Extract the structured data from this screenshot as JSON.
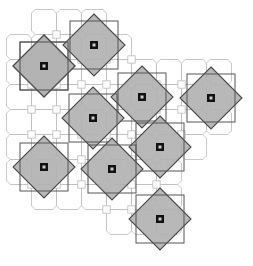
{
  "figure": {
    "width": 253,
    "height": 266,
    "background_color": "#ffffff"
  },
  "style": {
    "diamond_fill": "#b2b2b2",
    "diamond_stroke": "#4a4a4a",
    "frame_stroke": "#555555",
    "lattice_stroke": "#b9b9b9",
    "marker_fill": "#111111",
    "marker_inner_fill": "#cccccc",
    "diamond_stroke_width": 1.1,
    "frame_stroke_width": 1.0,
    "lattice_stroke_width": 0.8
  },
  "lattice": {
    "description": "truncated square tiling of octagons and small squares",
    "pitch": 25,
    "octagon_radius": 12.5,
    "cut": 3.66,
    "origin_x": 19,
    "origin_y": 22,
    "columns": 9,
    "rows": 9,
    "visible_cells": [
      [
        1,
        0
      ],
      [
        2,
        0
      ],
      [
        3,
        0
      ],
      [
        0,
        1
      ],
      [
        1,
        1
      ],
      [
        2,
        1
      ],
      [
        3,
        1
      ],
      [
        4,
        1
      ],
      [
        0,
        2
      ],
      [
        1,
        2
      ],
      [
        2,
        2
      ],
      [
        3,
        2
      ],
      [
        4,
        2
      ],
      [
        5,
        2
      ],
      [
        6,
        2
      ],
      [
        7,
        2
      ],
      [
        8,
        2
      ],
      [
        0,
        3
      ],
      [
        1,
        3
      ],
      [
        2,
        3
      ],
      [
        3,
        3
      ],
      [
        4,
        3
      ],
      [
        5,
        3
      ],
      [
        6,
        3
      ],
      [
        7,
        3
      ],
      [
        8,
        3
      ],
      [
        0,
        4
      ],
      [
        1,
        4
      ],
      [
        2,
        4
      ],
      [
        3,
        4
      ],
      [
        4,
        4
      ],
      [
        5,
        4
      ],
      [
        6,
        4
      ],
      [
        7,
        4
      ],
      [
        8,
        4
      ],
      [
        0,
        5
      ],
      [
        1,
        5
      ],
      [
        2,
        5
      ],
      [
        3,
        5
      ],
      [
        4,
        5
      ],
      [
        5,
        5
      ],
      [
        6,
        5
      ],
      [
        7,
        5
      ],
      [
        0,
        6
      ],
      [
        1,
        6
      ],
      [
        2,
        6
      ],
      [
        3,
        6
      ],
      [
        4,
        6
      ],
      [
        5,
        6
      ],
      [
        6,
        6
      ],
      [
        1,
        7
      ],
      [
        2,
        7
      ],
      [
        3,
        7
      ],
      [
        4,
        7
      ],
      [
        5,
        7
      ],
      [
        6,
        7
      ],
      [
        4,
        8
      ],
      [
        5,
        8
      ],
      [
        6,
        8
      ]
    ]
  },
  "tiles": {
    "count": 10,
    "half_diagonal": 31,
    "frame_half_side": 24,
    "marker_size": 8,
    "marker_inner_size": 3,
    "items": [
      {
        "id": "tile-1",
        "label": "A",
        "cx": 44,
        "cy": 66
      },
      {
        "id": "tile-2",
        "label": "B",
        "cx": 94,
        "cy": 45
      },
      {
        "id": "tile-3",
        "label": "C",
        "cx": 142,
        "cy": 97
      },
      {
        "id": "tile-4",
        "label": "D",
        "cx": 211,
        "cy": 98
      },
      {
        "id": "tile-5",
        "label": "E",
        "cx": 93,
        "cy": 118
      },
      {
        "id": "tile-6",
        "label": "F",
        "cx": 160,
        "cy": 147
      },
      {
        "id": "tile-7",
        "label": "G",
        "cx": 44,
        "cy": 167
      },
      {
        "id": "tile-8",
        "label": "H",
        "cx": 112,
        "cy": 169
      },
      {
        "id": "tile-9",
        "label": "I",
        "cx": 160,
        "cy": 219
      },
      {
        "id": "tile-10",
        "label": "J",
        "cx": 44,
        "cy": 66
      }
    ]
  }
}
